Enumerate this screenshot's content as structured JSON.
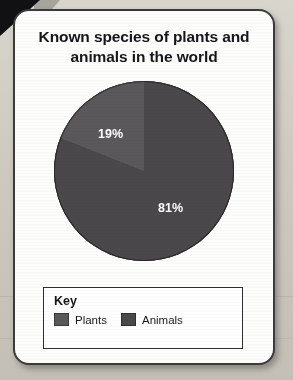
{
  "card": {
    "title": "Known species of plants and animals in the world"
  },
  "key": {
    "title": "Key",
    "items": [
      {
        "label": "Plants",
        "color": "#5a585b"
      },
      {
        "label": "Animals",
        "color": "#4a484b"
      }
    ]
  },
  "chart_data": {
    "type": "pie",
    "title": "Known species of plants and animals in the world",
    "categories": [
      "Plants",
      "Animals"
    ],
    "values": [
      19,
      81
    ],
    "value_labels": [
      "19%",
      "81%"
    ],
    "colors": [
      "#5a585b",
      "#4a484b"
    ],
    "legend_position": "bottom",
    "grid": false,
    "start_angle_deg": 0
  }
}
